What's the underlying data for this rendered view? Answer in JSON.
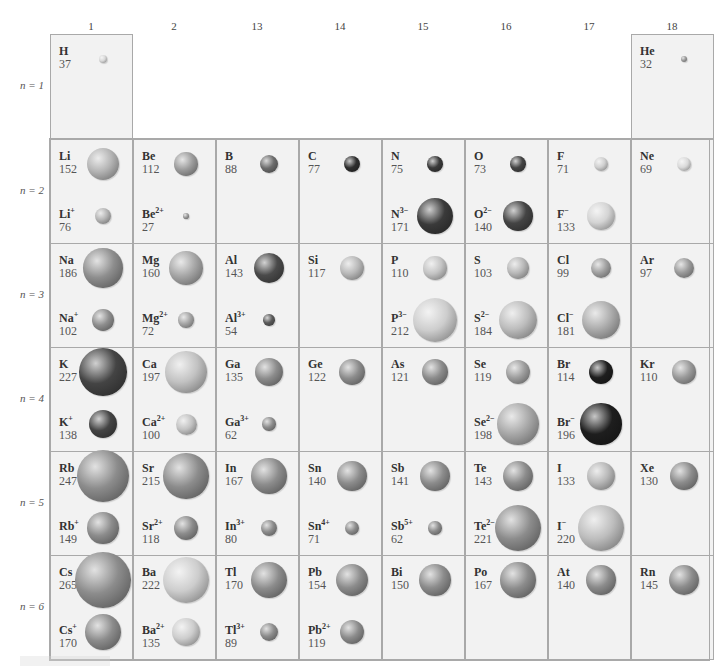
{
  "chart_data": {
    "type": "table",
    "groups": [
      "1",
      "2",
      "13",
      "14",
      "15",
      "16",
      "17",
      "18"
    ],
    "periods": [
      "n = 1",
      "n = 2",
      "n = 3",
      "n = 4",
      "n = 5",
      "n = 6"
    ],
    "units": "pm",
    "cells": [
      {
        "group": "1",
        "period": 1,
        "atom": {
          "symbol": "H",
          "charge": "",
          "radius": 37,
          "color": "#d8d8d8"
        }
      },
      {
        "group": "18",
        "period": 1,
        "atom": {
          "symbol": "He",
          "charge": "",
          "radius": 32,
          "color": "#9a9a9a"
        }
      },
      {
        "group": "1",
        "period": 2,
        "atom": {
          "symbol": "Li",
          "charge": "",
          "radius": 152,
          "color": "#b4b4b4"
        },
        "ion": {
          "symbol": "Li",
          "charge": "+",
          "radius": 76,
          "color": "#b4b4b4"
        }
      },
      {
        "group": "2",
        "period": 2,
        "atom": {
          "symbol": "Be",
          "charge": "",
          "radius": 112,
          "color": "#9c9c9c"
        },
        "ion": {
          "symbol": "Be",
          "charge": "2+",
          "radius": 27,
          "color": "#9c9c9c"
        }
      },
      {
        "group": "13",
        "period": 2,
        "atom": {
          "symbol": "B",
          "charge": "",
          "radius": 88,
          "color": "#6c6c6c"
        }
      },
      {
        "group": "14",
        "period": 2,
        "atom": {
          "symbol": "C",
          "charge": "",
          "radius": 77,
          "color": "#2e2e2e"
        }
      },
      {
        "group": "15",
        "period": 2,
        "atom": {
          "symbol": "N",
          "charge": "",
          "radius": 75,
          "color": "#3a3a3a"
        },
        "ion": {
          "symbol": "N",
          "charge": "3−",
          "radius": 171,
          "color": "#3a3a3a"
        }
      },
      {
        "group": "16",
        "period": 2,
        "atom": {
          "symbol": "O",
          "charge": "",
          "radius": 73,
          "color": "#444444"
        },
        "ion": {
          "symbol": "O",
          "charge": "2−",
          "radius": 140,
          "color": "#444444"
        }
      },
      {
        "group": "17",
        "period": 2,
        "atom": {
          "symbol": "F",
          "charge": "",
          "radius": 71,
          "color": "#cfcfcf"
        },
        "ion": {
          "symbol": "F",
          "charge": "−",
          "radius": 133,
          "color": "#d4d4d4"
        }
      },
      {
        "group": "18",
        "period": 2,
        "atom": {
          "symbol": "Ne",
          "charge": "",
          "radius": 69,
          "color": "#dadada"
        }
      },
      {
        "group": "1",
        "period": 3,
        "atom": {
          "symbol": "Na",
          "charge": "",
          "radius": 186,
          "color": "#8e8e8e"
        },
        "ion": {
          "symbol": "Na",
          "charge": "+",
          "radius": 102,
          "color": "#8e8e8e"
        }
      },
      {
        "group": "2",
        "period": 3,
        "atom": {
          "symbol": "Mg",
          "charge": "",
          "radius": 160,
          "color": "#a6a6a6"
        },
        "ion": {
          "symbol": "Mg",
          "charge": "2+",
          "radius": 72,
          "color": "#a6a6a6"
        }
      },
      {
        "group": "13",
        "period": 3,
        "atom": {
          "symbol": "Al",
          "charge": "",
          "radius": 143,
          "color": "#4a4a4a"
        },
        "ion": {
          "symbol": "Al",
          "charge": "3+",
          "radius": 54,
          "color": "#5a5a5a"
        }
      },
      {
        "group": "14",
        "period": 3,
        "atom": {
          "symbol": "Si",
          "charge": "",
          "radius": 117,
          "color": "#b8b8b8"
        }
      },
      {
        "group": "15",
        "period": 3,
        "atom": {
          "symbol": "P",
          "charge": "",
          "radius": 110,
          "color": "#c4c4c4"
        },
        "ion": {
          "symbol": "P",
          "charge": "3−",
          "radius": 212,
          "color": "#cdcdcd"
        }
      },
      {
        "group": "16",
        "period": 3,
        "atom": {
          "symbol": "S",
          "charge": "",
          "radius": 103,
          "color": "#b8b8b8"
        },
        "ion": {
          "symbol": "S",
          "charge": "2−",
          "radius": 184,
          "color": "#bdbdbd"
        }
      },
      {
        "group": "17",
        "period": 3,
        "atom": {
          "symbol": "Cl",
          "charge": "",
          "radius": 99,
          "color": "#a0a0a0"
        },
        "ion": {
          "symbol": "Cl",
          "charge": "−",
          "radius": 181,
          "color": "#acacac"
        }
      },
      {
        "group": "18",
        "period": 3,
        "atom": {
          "symbol": "Ar",
          "charge": "",
          "radius": 97,
          "color": "#9a9a9a"
        }
      },
      {
        "group": "1",
        "period": 4,
        "atom": {
          "symbol": "K",
          "charge": "",
          "radius": 227,
          "color": "#444444"
        },
        "ion": {
          "symbol": "K",
          "charge": "+",
          "radius": 138,
          "color": "#444444"
        }
      },
      {
        "group": "2",
        "period": 4,
        "atom": {
          "symbol": "Ca",
          "charge": "",
          "radius": 197,
          "color": "#c2c2c2"
        },
        "ion": {
          "symbol": "Ca",
          "charge": "2+",
          "radius": 100,
          "color": "#c2c2c2"
        }
      },
      {
        "group": "13",
        "period": 4,
        "atom": {
          "symbol": "Ga",
          "charge": "",
          "radius": 135,
          "color": "#8c8c8c"
        },
        "ion": {
          "symbol": "Ga",
          "charge": "3+",
          "radius": 62,
          "color": "#8c8c8c"
        }
      },
      {
        "group": "14",
        "period": 4,
        "atom": {
          "symbol": "Ge",
          "charge": "",
          "radius": 122,
          "color": "#8c8c8c"
        }
      },
      {
        "group": "15",
        "period": 4,
        "atom": {
          "symbol": "As",
          "charge": "",
          "radius": 121,
          "color": "#8c8c8c"
        }
      },
      {
        "group": "16",
        "period": 4,
        "atom": {
          "symbol": "Se",
          "charge": "",
          "radius": 119,
          "color": "#9e9e9e"
        },
        "ion": {
          "symbol": "Se",
          "charge": "2−",
          "radius": 198,
          "color": "#a8a8a8"
        }
      },
      {
        "group": "17",
        "period": 4,
        "atom": {
          "symbol": "Br",
          "charge": "",
          "radius": 114,
          "color": "#1e1e1e"
        },
        "ion": {
          "symbol": "Br",
          "charge": "−",
          "radius": 196,
          "color": "#1e1e1e"
        }
      },
      {
        "group": "18",
        "period": 4,
        "atom": {
          "symbol": "Kr",
          "charge": "",
          "radius": 110,
          "color": "#9a9a9a"
        }
      },
      {
        "group": "1",
        "period": 5,
        "atom": {
          "symbol": "Rb",
          "charge": "",
          "radius": 247,
          "color": "#8c8c8c"
        },
        "ion": {
          "symbol": "Rb",
          "charge": "+",
          "radius": 149,
          "color": "#8c8c8c"
        }
      },
      {
        "group": "2",
        "period": 5,
        "atom": {
          "symbol": "Sr",
          "charge": "",
          "radius": 215,
          "color": "#8c8c8c"
        },
        "ion": {
          "symbol": "Sr",
          "charge": "2+",
          "radius": 118,
          "color": "#8c8c8c"
        }
      },
      {
        "group": "13",
        "period": 5,
        "atom": {
          "symbol": "In",
          "charge": "",
          "radius": 167,
          "color": "#8c8c8c"
        },
        "ion": {
          "symbol": "In",
          "charge": "3+",
          "radius": 80,
          "color": "#8c8c8c"
        }
      },
      {
        "group": "14",
        "period": 5,
        "atom": {
          "symbol": "Sn",
          "charge": "",
          "radius": 140,
          "color": "#8c8c8c"
        },
        "ion": {
          "symbol": "Sn",
          "charge": "4+",
          "radius": 71,
          "color": "#8c8c8c"
        }
      },
      {
        "group": "15",
        "period": 5,
        "atom": {
          "symbol": "Sb",
          "charge": "",
          "radius": 141,
          "color": "#8c8c8c"
        },
        "ion": {
          "symbol": "Sb",
          "charge": "5+",
          "radius": 62,
          "color": "#8c8c8c"
        }
      },
      {
        "group": "16",
        "period": 5,
        "atom": {
          "symbol": "Te",
          "charge": "",
          "radius": 143,
          "color": "#8c8c8c"
        },
        "ion": {
          "symbol": "Te",
          "charge": "2−",
          "radius": 221,
          "color": "#8c8c8c"
        }
      },
      {
        "group": "17",
        "period": 5,
        "atom": {
          "symbol": "I",
          "charge": "",
          "radius": 133,
          "color": "#b8b8b8"
        },
        "ion": {
          "symbol": "I",
          "charge": "−",
          "radius": 220,
          "color": "#bdbdbd"
        }
      },
      {
        "group": "18",
        "period": 5,
        "atom": {
          "symbol": "Xe",
          "charge": "",
          "radius": 130,
          "color": "#8c8c8c"
        }
      },
      {
        "group": "1",
        "period": 6,
        "atom": {
          "symbol": "Cs",
          "charge": "",
          "radius": 265,
          "color": "#8c8c8c"
        },
        "ion": {
          "symbol": "Cs",
          "charge": "+",
          "radius": 170,
          "color": "#8c8c8c"
        }
      },
      {
        "group": "2",
        "period": 6,
        "atom": {
          "symbol": "Ba",
          "charge": "",
          "radius": 222,
          "color": "#cdcdcd"
        },
        "ion": {
          "symbol": "Ba",
          "charge": "2+",
          "radius": 135,
          "color": "#cdcdcd"
        }
      },
      {
        "group": "13",
        "period": 6,
        "atom": {
          "symbol": "Tl",
          "charge": "",
          "radius": 170,
          "color": "#8c8c8c"
        },
        "ion": {
          "symbol": "Tl",
          "charge": "3+",
          "radius": 89,
          "color": "#8c8c8c"
        }
      },
      {
        "group": "14",
        "period": 6,
        "atom": {
          "symbol": "Pb",
          "charge": "",
          "radius": 154,
          "color": "#8c8c8c"
        },
        "ion": {
          "symbol": "Pb",
          "charge": "2+",
          "radius": 119,
          "color": "#8c8c8c"
        }
      },
      {
        "group": "15",
        "period": 6,
        "atom": {
          "symbol": "Bi",
          "charge": "",
          "radius": 150,
          "color": "#8c8c8c"
        }
      },
      {
        "group": "16",
        "period": 6,
        "atom": {
          "symbol": "Po",
          "charge": "",
          "radius": 167,
          "color": "#8c8c8c"
        }
      },
      {
        "group": "17",
        "period": 6,
        "atom": {
          "symbol": "At",
          "charge": "",
          "radius": 140,
          "color": "#8c8c8c"
        }
      },
      {
        "group": "18",
        "period": 6,
        "atom": {
          "symbol": "Rn",
          "charge": "",
          "radius": 145,
          "color": "#8c8c8c"
        }
      }
    ],
    "grid": true,
    "legend": null
  },
  "layout": {
    "group_x": {
      "1": 50,
      "2": 133,
      "13": 216,
      "14": 299,
      "15": 382,
      "16": 465,
      "17": 548,
      "18": 631
    },
    "period_y": {
      "1": 34,
      "2": 139,
      "3": 243,
      "4": 347,
      "5": 451,
      "6": 555
    },
    "cell_w": 82,
    "cell_h": 104,
    "px_per_pm": 0.21
  }
}
